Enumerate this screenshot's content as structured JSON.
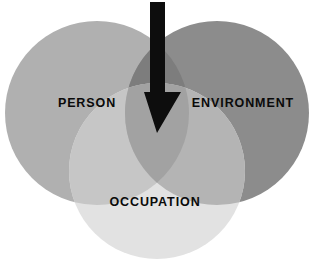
{
  "diagram": {
    "type": "venn-3-circle",
    "background_color": "#ffffff",
    "circles": [
      {
        "id": "person",
        "label": "PERSON",
        "fill": "#b0b0b0",
        "cx": 97,
        "cy": 113,
        "r": 92,
        "label_x": 87,
        "label_y": 104
      },
      {
        "id": "environment",
        "label": "ENVIRONMENT",
        "fill": "#8c8c8c",
        "cx": 217,
        "cy": 113,
        "r": 92,
        "label_x": 243,
        "label_y": 104
      },
      {
        "id": "occupation",
        "label": "OCCUPATION",
        "fill": "#e2e2e2",
        "cx": 157,
        "cy": 171,
        "r": 88,
        "label_x": 155,
        "label_y": 203
      }
    ],
    "overlaps": [
      {
        "id": "person-environment",
        "fill": "#7d7d7d"
      },
      {
        "id": "person-occupation",
        "fill": "#c6c6c6"
      },
      {
        "id": "environment-occupation",
        "fill": "#b4b4b4"
      },
      {
        "id": "person-environment-occupation",
        "fill": "#a2a2a2"
      }
    ],
    "arrow": {
      "id": "center-arrow",
      "color": "#0d0d0d",
      "description": "downward arrow pointing into the central overlap",
      "shaft_left": 150,
      "shaft_right": 165,
      "shaft_top": 2,
      "head_top": 92,
      "head_left": 144,
      "head_right": 181,
      "tip_x": 157,
      "tip_y": 133
    },
    "text_color": "#0a0a0a"
  }
}
